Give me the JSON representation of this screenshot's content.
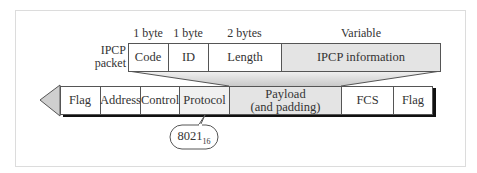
{
  "packet": {
    "label_line1": "IPCP",
    "label_line2": "packet",
    "sizes": [
      "1 byte",
      "1 byte",
      "2 bytes",
      "Variable"
    ],
    "fields": [
      "Code",
      "ID",
      "Length",
      "IPCP information"
    ]
  },
  "frame": {
    "fields": [
      "Flag",
      "Address",
      "Control",
      "Protocol",
      "Payload",
      "(and padding)",
      "FCS",
      "Flag"
    ]
  },
  "callout": {
    "value": "8021",
    "subscript": "16"
  },
  "colors": {
    "shaded": "#e4e4e4",
    "border": "#555555",
    "shadow": "#111111"
  }
}
